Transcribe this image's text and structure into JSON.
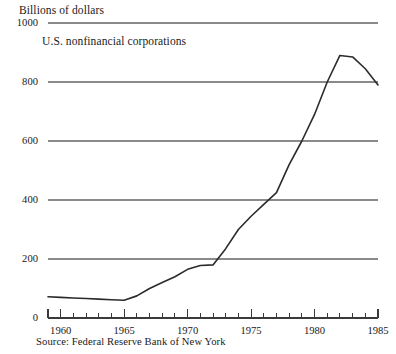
{
  "chart_data": {
    "type": "line",
    "title": "",
    "subtitle": "U.S. nonfinancial corporations",
    "ylabel": "Billions of dollars",
    "xlabel": "",
    "source": "Source: Federal Reserve Bank of New York",
    "ylim": [
      0,
      1000
    ],
    "xlim": [
      1959,
      1985
    ],
    "ytick_labels": [
      "0",
      "200",
      "400",
      "600",
      "800",
      "1000"
    ],
    "ytick_values": [
      0,
      200,
      400,
      600,
      800,
      1000
    ],
    "xtick_labels": [
      "1960",
      "1965",
      "1970",
      "1975",
      "1980",
      "1985"
    ],
    "xtick_values": [
      1960,
      1965,
      1970,
      1975,
      1980,
      1985
    ],
    "minor_tick_interval": 1,
    "grid": "horizontal",
    "legend": "none",
    "line_color": "#2b2b2b",
    "grid_color": "#8a8a8a",
    "axis_color": "#3a3a3a",
    "background_color": "#ffffff",
    "series": [
      {
        "name": "U.S. nonfinancial corporations",
        "x": [
          1959,
          1960,
          1961,
          1962,
          1963,
          1964,
          1965,
          1966,
          1967,
          1968,
          1969,
          1970,
          1971,
          1972,
          1973,
          1974,
          1975,
          1976,
          1977,
          1978,
          1979,
          1980,
          1981,
          1982,
          1983,
          1984,
          1985
        ],
        "values": [
          72,
          70,
          68,
          66,
          64,
          62,
          60,
          75,
          100,
          120,
          140,
          165,
          178,
          180,
          235,
          300,
          345,
          385,
          425,
          520,
          600,
          690,
          800,
          890,
          885,
          845,
          790
        ]
      }
    ]
  },
  "layout": {
    "plot_left_px": 48,
    "plot_right_px": 378,
    "plot_top_px": 23,
    "plot_bottom_px": 318
  }
}
